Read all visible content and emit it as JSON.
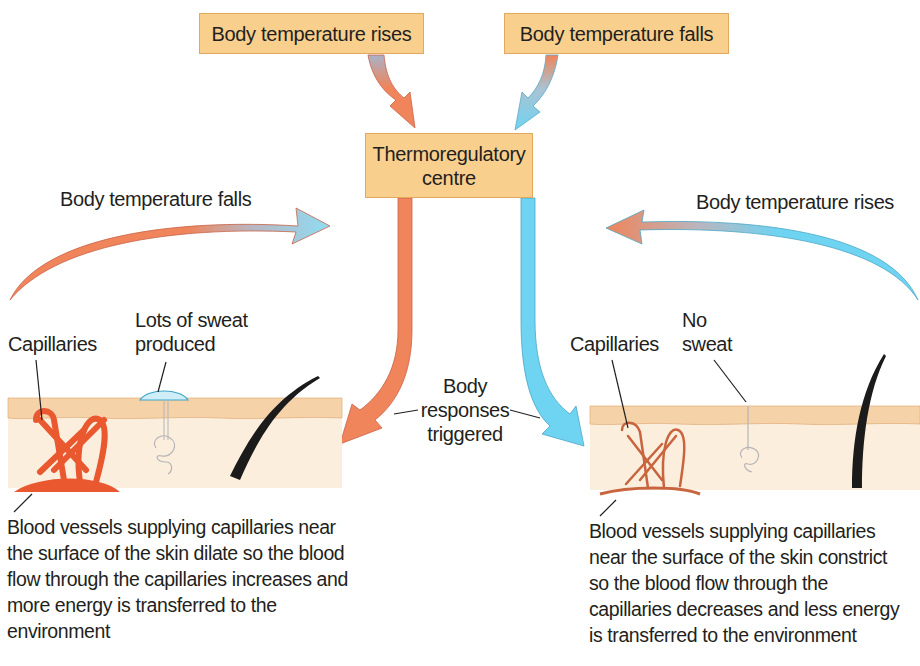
{
  "diagram": {
    "top_boxes": {
      "rises": "Body temperature rises",
      "falls": "Body temperature falls"
    },
    "centre_box": {
      "line1": "Thermoregulatory",
      "line2": "centre"
    },
    "left_arc_label": "Body temperature falls",
    "right_arc_label": "Body temperature rises",
    "middle_label": {
      "line1": "Body",
      "line2": "responses",
      "line3": "triggered"
    },
    "left_skin": {
      "capillaries_label": "Capillaries",
      "sweat_label_line1": "Lots of sweat",
      "sweat_label_line2": "produced",
      "description": [
        "Blood vessels supplying capillaries near",
        "the surface of the skin dilate so the blood",
        "flow through the capillaries increases and",
        "more energy is transferred to the",
        "environment"
      ]
    },
    "right_skin": {
      "capillaries_label": "Capillaries",
      "sweat_label_line1": "No",
      "sweat_label_line2": "sweat",
      "description": [
        "Blood vessels supplying capillaries",
        "near the surface of the skin constrict",
        "so the blood flow through the",
        "capillaries decreases and less energy",
        "is transferred to the environment"
      ]
    },
    "colors": {
      "warm_arrow": "#f0845a",
      "cool_arrow": "#6fd3f2",
      "box_fill": "#f9cf8e",
      "skin_epidermis": "#f5d2a8",
      "skin_dermis": "#fbeedd",
      "capillary_dilated": "#e9582e",
      "capillary_constricted": "#c8643e"
    }
  }
}
